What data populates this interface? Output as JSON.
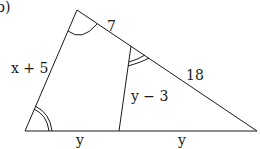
{
  "figure": {
    "part_label": "b)",
    "labels": {
      "left_side": "x + 5",
      "top_right_short": "7",
      "top_right_long": "18",
      "inner_segment": "y − 3",
      "base_left": "y",
      "base_right": "y"
    },
    "colors": {
      "stroke": "#1a1a1a",
      "background": "#ffffff"
    }
  }
}
